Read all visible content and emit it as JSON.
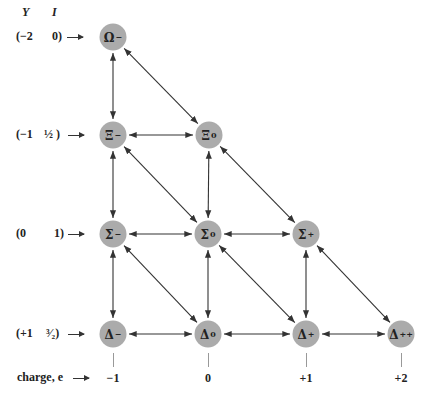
{
  "axes": {
    "y_header": "Y",
    "i_header": "I",
    "charge_label": "charge, e"
  },
  "rows": [
    {
      "y": "(−2",
      "i": "0)",
      "top": 37
    },
    {
      "y": "(−1",
      "i": "½ )",
      "top": 135
    },
    {
      "y": "(0",
      "i": "1)",
      "top": 234
    },
    {
      "y": "(+1",
      "i": "³⁄₂)",
      "top": 334
    }
  ],
  "charges": [
    {
      "label": "−1",
      "x": 113
    },
    {
      "label": "0",
      "x": 208
    },
    {
      "label": "+1",
      "x": 306
    },
    {
      "label": "+2",
      "x": 401
    }
  ],
  "nodes": [
    {
      "id": "omega-minus",
      "symbol": "Ω",
      "sup": "−",
      "x": 113,
      "y": 37
    },
    {
      "id": "xi-minus",
      "symbol": "Ξ",
      "sup": "−",
      "x": 113,
      "y": 135
    },
    {
      "id": "xi-zero",
      "symbol": "Ξ",
      "sup": "0",
      "x": 209,
      "y": 135
    },
    {
      "id": "sigma-minus",
      "symbol": "Σ",
      "sup": "−",
      "x": 113,
      "y": 234
    },
    {
      "id": "sigma-zero",
      "symbol": "Σ",
      "sup": "0",
      "x": 208,
      "y": 234
    },
    {
      "id": "sigma-plus",
      "symbol": "Σ",
      "sup": "+",
      "x": 306,
      "y": 234
    },
    {
      "id": "delta-minus",
      "symbol": "Δ",
      "sup": "−",
      "x": 113,
      "y": 334
    },
    {
      "id": "delta-zero",
      "symbol": "Δ",
      "sup": "0",
      "x": 208,
      "y": 334
    },
    {
      "id": "delta-plus",
      "symbol": "Δ",
      "sup": "+",
      "x": 306,
      "y": 334
    },
    {
      "id": "delta-plusplus",
      "symbol": "Δ",
      "sup": "++",
      "x": 401,
      "y": 334
    }
  ],
  "edges": [
    [
      "omega-minus",
      "xi-minus"
    ],
    [
      "omega-minus",
      "xi-zero"
    ],
    [
      "xi-minus",
      "xi-zero"
    ],
    [
      "xi-minus",
      "sigma-minus"
    ],
    [
      "xi-minus",
      "sigma-zero"
    ],
    [
      "xi-zero",
      "sigma-zero"
    ],
    [
      "xi-zero",
      "sigma-plus"
    ],
    [
      "sigma-minus",
      "sigma-zero"
    ],
    [
      "sigma-zero",
      "sigma-plus"
    ],
    [
      "sigma-minus",
      "delta-minus"
    ],
    [
      "sigma-minus",
      "delta-zero"
    ],
    [
      "sigma-zero",
      "delta-zero"
    ],
    [
      "sigma-zero",
      "delta-plus"
    ],
    [
      "sigma-plus",
      "delta-plus"
    ],
    [
      "sigma-plus",
      "delta-plusplus"
    ],
    [
      "delta-minus",
      "delta-zero"
    ],
    [
      "delta-zero",
      "delta-plus"
    ],
    [
      "delta-plus",
      "delta-plusplus"
    ]
  ],
  "colors": {
    "node_fill": "#ababab",
    "line": "#333333",
    "tick": "#999999"
  }
}
